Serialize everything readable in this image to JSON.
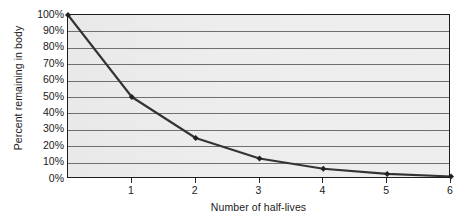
{
  "chart_data": {
    "type": "line",
    "title": "",
    "xlabel": "Number of half-lives",
    "ylabel": "Percent remaining in body",
    "x": [
      0,
      1,
      2,
      3,
      4,
      5,
      6
    ],
    "values": [
      100,
      50,
      25,
      12.5,
      6.25,
      3.125,
      1.5625
    ],
    "series": [
      {
        "name": "Percent remaining in body",
        "values": [
          100,
          50,
          25,
          12.5,
          6.25,
          3.125,
          1.5625
        ]
      }
    ],
    "xlim": [
      0,
      6
    ],
    "ylim": [
      0,
      100
    ],
    "x_tick_labels": [
      "1",
      "2",
      "3",
      "4",
      "5",
      "6"
    ],
    "x_tick_values": [
      1,
      2,
      3,
      4,
      5,
      6
    ],
    "y_tick_labels": [
      "100%",
      "90%",
      "80%",
      "70%",
      "60%",
      "50%",
      "40%",
      "30%",
      "20%",
      "10%",
      "0%"
    ],
    "y_tick_values": [
      100,
      90,
      80,
      70,
      60,
      50,
      40,
      30,
      20,
      10,
      0
    ],
    "grid": "horizontal",
    "legend": "none",
    "marker": "diamond",
    "colors": {
      "line": "#333333",
      "marker": "#222222",
      "plot_background": "#ececec",
      "gridline": "#6f6f6f",
      "axis": "#1d1d1d",
      "text": "#1a1a1a"
    }
  }
}
